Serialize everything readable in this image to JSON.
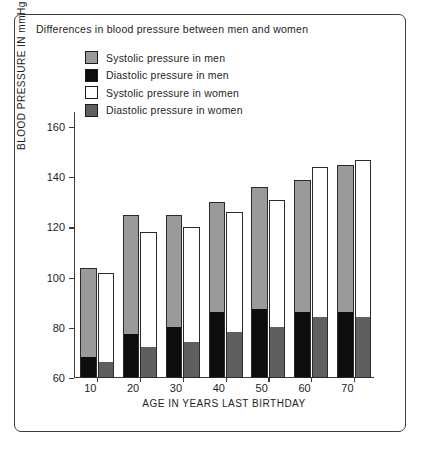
{
  "chart_data": {
    "type": "bar",
    "title": "Differences in blood pressure between men and women",
    "xlabel": "AGE IN YEARS LAST BIRTHDAY",
    "ylabel": "BLOOD PRESSURE IN mmHg",
    "categories": [
      "10",
      "20",
      "30",
      "40",
      "50",
      "60",
      "70"
    ],
    "ylim": [
      60,
      166
    ],
    "yticks": [
      60,
      80,
      100,
      120,
      140,
      160
    ],
    "grid": false,
    "legend_position": "top-center",
    "series": [
      {
        "name": "Systolic pressure in men",
        "color": "#9a9a9a",
        "values": [
          104,
          125,
          125,
          130,
          136,
          139,
          145
        ]
      },
      {
        "name": "Diastolic pressure in men",
        "color": "#0d0d0d",
        "values": [
          68,
          77,
          80,
          86,
          87,
          86,
          86
        ]
      },
      {
        "name": "Systolic pressure in women",
        "color": "#ffffff",
        "values": [
          102,
          118,
          120,
          126,
          131,
          144,
          147
        ]
      },
      {
        "name": "Diastolic pressure in women",
        "color": "#5f5f5f",
        "values": [
          66,
          72,
          74,
          78,
          80,
          84,
          84
        ]
      }
    ]
  },
  "legend": {
    "items": [
      {
        "label": "Systolic pressure in men",
        "color": "#9a9a9a"
      },
      {
        "label": "Diastolic pressure in men",
        "color": "#0d0d0d"
      },
      {
        "label": "Systolic pressure in women",
        "color": "#ffffff"
      },
      {
        "label": "Diastolic pressure in women",
        "color": "#5f5f5f"
      }
    ]
  }
}
